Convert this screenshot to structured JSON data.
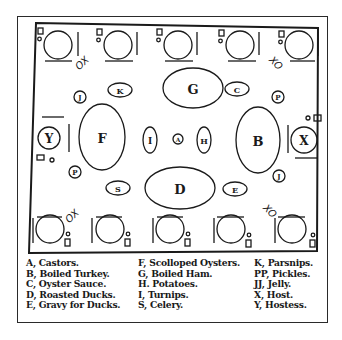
{
  "diagram": {
    "ox_labels": [
      "OX",
      "XO",
      "OX",
      "XO"
    ],
    "dishes": {
      "A": "A",
      "B": "B",
      "C": "C",
      "D": "D",
      "E": "E",
      "F": "F",
      "G": "G",
      "H": "H",
      "I": "I",
      "J": "J",
      "K": "K",
      "P": "P",
      "S": "S",
      "X": "X",
      "Y": "Y"
    }
  },
  "legend": {
    "columns": [
      [
        "A, Castors.",
        "B, Boiled Turkey.",
        "C, Oyster Sauce.",
        "D, Roasted Ducks.",
        "E, Gravy for Ducks."
      ],
      [
        "F, Scolloped Oysters.",
        "G, Boiled Ham.",
        "H. Potatoes.",
        "I, Turnips.",
        "S, Celery."
      ],
      [
        "K, Parsnips.",
        "PP, Pickles.",
        "JJ, Jelly.",
        "X, Host.",
        "Y, Hostess."
      ]
    ]
  }
}
